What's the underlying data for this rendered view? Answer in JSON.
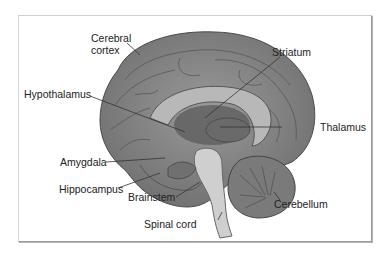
{
  "figure": {
    "labels": {
      "cerebral_cortex": "Cerebral\ncortex",
      "cerebral_cortex_line1": "Cerebral",
      "cerebral_cortex_line2": "cortex",
      "striatum": "Striatum",
      "hypothalamus": "Hypothalamus",
      "thalamus": "Thalamus",
      "amygdala": "Amygdala",
      "hippocampus": "Hippocampus",
      "brainstem": "Brainstem",
      "cerebellum": "Cerebellum",
      "spinal_cord": "Spinal cord"
    },
    "colors": {
      "brain_fill": "#8a8a8a",
      "brain_dark": "#5e5e5e",
      "brainstem_fill": "#c9c9c9",
      "cerebellum_fill": "#7a7a7a",
      "leader_line": "#333333",
      "frame_border": "#9a9a9a"
    }
  }
}
